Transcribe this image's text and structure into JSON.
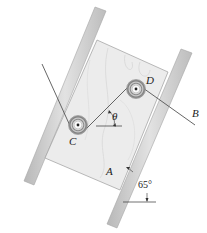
{
  "figure": {
    "labels": {
      "pulley_c": "C",
      "pulley_d": "D",
      "rope_end_b": "B",
      "block_a": "A",
      "theta": "θ",
      "rail_angle": "65°"
    },
    "colors": {
      "rail": "#cfcfcf",
      "rail_edge": "#9a9a9a",
      "block": "#ececec",
      "block_grain": "#d6d6d6",
      "rope": "#555555",
      "pulley_ring": "#8a8a8a",
      "text": "#222222"
    }
  }
}
